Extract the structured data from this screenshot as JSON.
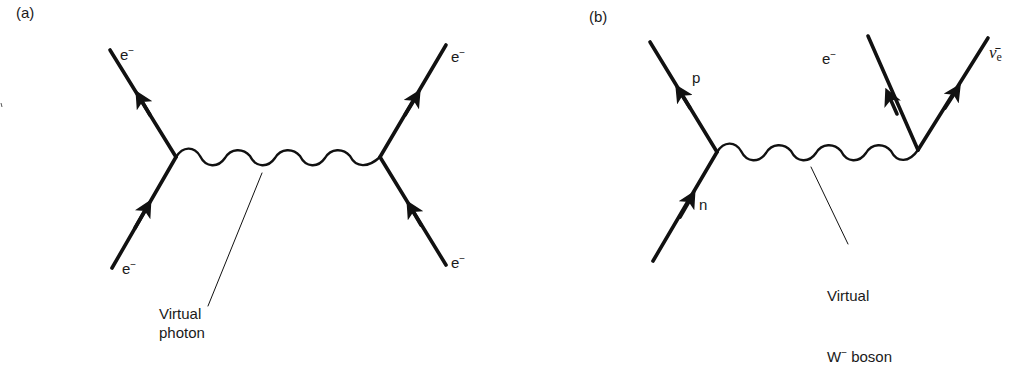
{
  "figure": {
    "panels": [
      {
        "id": "a",
        "label": "(a)",
        "particles": {
          "top_left": {
            "symbol": "e",
            "superscript": "−"
          },
          "bottom_left": {
            "symbol": "e",
            "superscript": "−"
          },
          "top_right": {
            "symbol": "e",
            "superscript": "−"
          },
          "bottom_right": {
            "symbol": "e",
            "superscript": "−"
          }
        },
        "exchange_caption": "Virtual\nphoton"
      },
      {
        "id": "b",
        "label": "(b)",
        "particles": {
          "top_left": {
            "symbol": "p"
          },
          "bottom_left": {
            "symbol": "n"
          },
          "top_middle": {
            "symbol": "e",
            "superscript": "−"
          },
          "top_right": {
            "symbol": "ν̄",
            "subscript": "e"
          }
        },
        "exchange_caption_line1": "Virtual",
        "exchange_caption_line2_main": "W",
        "exchange_caption_line2_sup": "−",
        "exchange_caption_line2_rest": " boson"
      }
    ],
    "colors": {
      "line": "#111111",
      "background": "#ffffff"
    }
  }
}
